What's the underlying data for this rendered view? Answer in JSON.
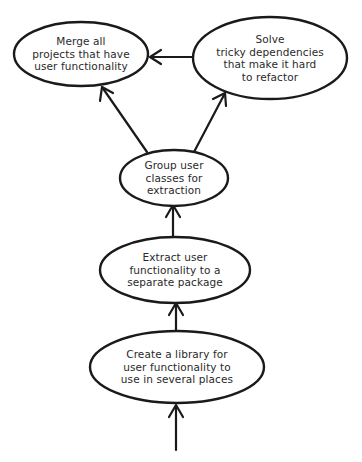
{
  "diagram": {
    "type": "hand-drawn flow diagram",
    "nodes": [
      {
        "id": "merge",
        "lines": [
          "Merge all",
          "projects that have",
          "user functionality"
        ]
      },
      {
        "id": "solve",
        "lines": [
          "Solve",
          "tricky dependencies",
          "that make it hard",
          "to refactor"
        ]
      },
      {
        "id": "group",
        "lines": [
          "Group user",
          "classes for",
          "extraction"
        ]
      },
      {
        "id": "extract",
        "lines": [
          "Extract user",
          "functionality to a",
          "separate package"
        ]
      },
      {
        "id": "create",
        "lines": [
          "Create a library for",
          "user functionality to",
          "use in several places"
        ]
      }
    ],
    "edges": [
      {
        "from": "start",
        "to": "create"
      },
      {
        "from": "create",
        "to": "extract"
      },
      {
        "from": "extract",
        "to": "group"
      },
      {
        "from": "group",
        "to": "merge"
      },
      {
        "from": "group",
        "to": "solve"
      },
      {
        "from": "solve",
        "to": "merge"
      }
    ],
    "colors": {
      "stroke": "#1a1a1a",
      "text": "#2a2a2a",
      "background": "#ffffff"
    }
  }
}
